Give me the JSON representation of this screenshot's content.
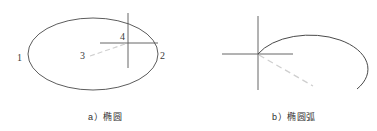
{
  "figure": {
    "background_color": "#ffffff",
    "stroke_color": "#4a4a4a",
    "axis_color": "#555555",
    "dashed_color": "#c9c9c9",
    "text_color": "#3c3c3c",
    "panels": [
      {
        "id": "a",
        "caption": "a）椭圆",
        "shape": "ellipse",
        "point_labels": [
          {
            "label": "1",
            "x": 18,
            "y": 58
          },
          {
            "label": "2",
            "x": 160,
            "y": 55
          },
          {
            "label": "3",
            "x": 81,
            "y": 54
          },
          {
            "label": "4",
            "x": 120,
            "y": 32
          }
        ],
        "geometry": {
          "ellipse_cx": 93,
          "ellipse_cy": 54,
          "ellipse_rx": 65,
          "ellipse_ry": 36,
          "cross_x": 128,
          "cross_y": 43,
          "cross_v_top": 13,
          "cross_v_bottom": 68,
          "cross_h_left": 100,
          "cross_h_right": 158,
          "dash_x1": 90,
          "dash_y1": 56,
          "dash_x2": 128,
          "dash_y2": 43
        }
      },
      {
        "id": "b",
        "caption": "b）椭圆弧",
        "shape": "elliptical-arc",
        "point_labels": [],
        "geometry": {
          "cross_x": 258,
          "cross_y": 54,
          "cross_v_top": 16,
          "cross_v_bottom": 90,
          "cross_h_left": 222,
          "cross_h_right": 293,
          "arc_start_x": 258,
          "arc_start_y": 54,
          "arc_rx": 58,
          "arc_ry": 34,
          "arc_end_x": 357,
          "arc_end_y": 89,
          "dash_x1": 259,
          "dash_y1": 55,
          "dash_x2": 313,
          "dash_y2": 86
        }
      }
    ]
  },
  "captions": {
    "panel_a": "a）椭圆",
    "panel_b": "b）椭圆弧"
  },
  "labels": {
    "one": "1",
    "two": "2",
    "three": "3",
    "four": "4"
  }
}
